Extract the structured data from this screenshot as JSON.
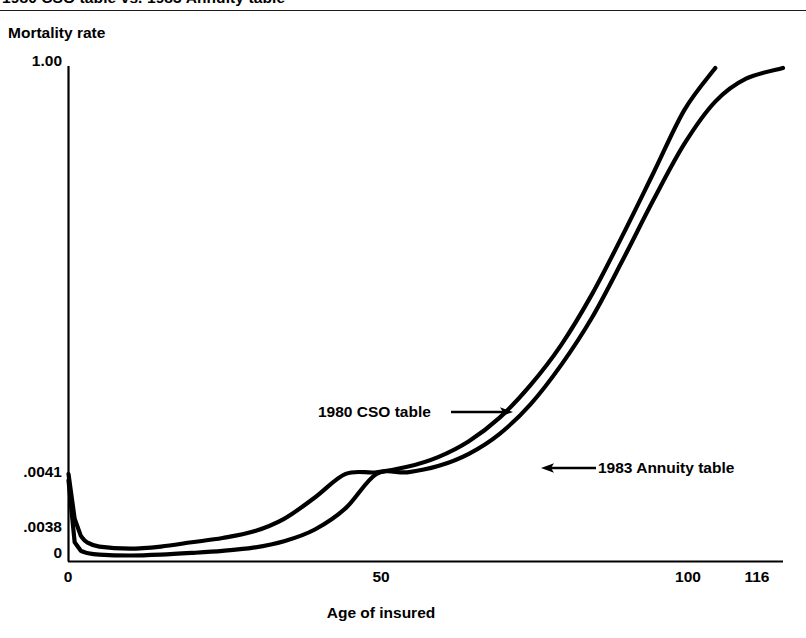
{
  "figure": {
    "caption": "1980 CSO table vs. 1983 Annuity table",
    "rule_color": "#1b1b1b",
    "background": "#ffffff",
    "ink_color": "#000000"
  },
  "chart_data": {
    "type": "line",
    "title": "1980 CSO table vs. 1983 Annuity table",
    "subtitle": "",
    "xlabel": "Age of insured",
    "ylabel": "Mortality rate",
    "xlim": [
      0,
      116
    ],
    "ylim": [
      0,
      1.0
    ],
    "xticks": [
      0,
      50,
      100,
      116
    ],
    "xtick_labels": [
      "0",
      "50",
      "100",
      "116"
    ],
    "yticks": [
      0,
      0.0038,
      0.0041,
      1.0
    ],
    "ytick_labels": [
      "0",
      ".0038",
      ".0041",
      "1.00"
    ],
    "grid": false,
    "legend": "annotations-on-curves",
    "axis_scale_note": "y axis is broken/compressed near zero so that .0038 and .0041 are legible",
    "series": [
      {
        "name": "1980 CSO table",
        "label_position": "left-of-curve-with-right-arrow",
        "x": [
          0,
          1,
          2,
          3,
          5,
          10,
          15,
          20,
          25,
          30,
          35,
          40,
          45,
          50,
          55,
          60,
          65,
          70,
          75,
          80,
          85,
          90,
          95,
          100,
          105
        ],
        "y": [
          0.0041,
          0.002,
          0.0012,
          0.0009,
          0.0007,
          0.0006,
          0.0007,
          0.0009,
          0.0011,
          0.0014,
          0.002,
          0.003,
          0.0047,
          0.007,
          0.011,
          0.017,
          0.027,
          0.044,
          0.073,
          0.12,
          0.2,
          0.33,
          0.52,
          0.78,
          1.0
        ]
      },
      {
        "name": "1983 Annuity table",
        "label_position": "right-of-curve-with-left-arrow",
        "x": [
          0,
          1,
          2,
          3,
          5,
          10,
          15,
          20,
          25,
          30,
          35,
          40,
          45,
          50,
          55,
          60,
          65,
          70,
          75,
          80,
          85,
          90,
          95,
          100,
          105,
          110,
          116
        ],
        "y": [
          0.0038,
          0.0009,
          0.0005,
          0.0004,
          0.00032,
          0.00028,
          0.00032,
          0.0004,
          0.0005,
          0.00065,
          0.00095,
          0.0015,
          0.0025,
          0.0042,
          0.007,
          0.0115,
          0.019,
          0.032,
          0.055,
          0.095,
          0.16,
          0.27,
          0.43,
          0.63,
          0.82,
          0.94,
          1.0
        ]
      }
    ],
    "annotations": [
      {
        "text": "1980 CSO table",
        "arrow": "right"
      },
      {
        "text": "1983 Annuity table",
        "arrow": "left"
      }
    ]
  }
}
